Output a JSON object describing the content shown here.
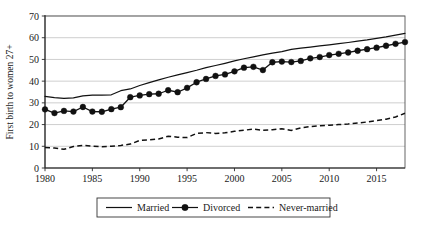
{
  "chart_data": {
    "type": "line",
    "title": "",
    "xlabel": "",
    "ylabel": "First birth to women 27+",
    "xlim": [
      1980,
      2018
    ],
    "ylim": [
      0,
      70
    ],
    "ytick_values": [
      0,
      10,
      20,
      30,
      40,
      50,
      60,
      70
    ],
    "ytick_labels": [
      "0",
      "10",
      "20",
      "30",
      "40",
      "50",
      "60",
      "70"
    ],
    "xtick_values": [
      1980,
      1985,
      1990,
      1995,
      2000,
      2005,
      2010,
      2015
    ],
    "xtick_labels": [
      "1980",
      "1985",
      "1990",
      "1995",
      "2000",
      "2005",
      "2010",
      "2015"
    ],
    "grid": "horizontal",
    "legend_position": "below-center",
    "x": [
      1980,
      1981,
      1982,
      1983,
      1984,
      1985,
      1986,
      1987,
      1988,
      1989,
      1990,
      1991,
      1992,
      1993,
      1994,
      1995,
      1996,
      1997,
      1998,
      1999,
      2000,
      2001,
      2002,
      2003,
      2004,
      2005,
      2006,
      2007,
      2008,
      2009,
      2010,
      2011,
      2012,
      2013,
      2014,
      2015,
      2016,
      2017,
      2018
    ],
    "series": [
      {
        "name": "Married",
        "style": "solid",
        "marker": "none",
        "color": "#111111",
        "values": [
          33.0,
          32.4,
          32.1,
          32.3,
          33.2,
          33.6,
          33.6,
          33.7,
          35.6,
          36.4,
          38.0,
          39.3,
          40.6,
          41.8,
          42.9,
          43.9,
          45.0,
          46.2,
          47.2,
          48.2,
          49.3,
          50.3,
          51.2,
          52.1,
          52.9,
          53.6,
          54.6,
          55.2,
          55.7,
          56.2,
          56.7,
          57.3,
          57.8,
          58.4,
          59.0,
          59.7,
          60.4,
          61.2,
          62.0
        ]
      },
      {
        "name": "Divorced",
        "style": "solid",
        "marker": "filled-circle",
        "color": "#111111",
        "values": [
          27.0,
          25.3,
          26.3,
          26.0,
          28.1,
          26.0,
          25.9,
          27.1,
          28.0,
          32.6,
          33.4,
          34.0,
          34.2,
          35.8,
          34.9,
          36.9,
          39.5,
          41.0,
          42.4,
          43.1,
          44.5,
          46.2,
          46.6,
          45.1,
          48.7,
          49.0,
          48.8,
          49.3,
          50.5,
          51.1,
          52.0,
          52.6,
          53.2,
          54.0,
          54.7,
          55.4,
          56.3,
          57.2,
          58.0
        ]
      },
      {
        "name": "Never-married",
        "style": "dashed",
        "marker": "none",
        "color": "#111111",
        "values": [
          9.4,
          9.2,
          8.6,
          9.9,
          10.4,
          10.1,
          9.8,
          10.0,
          10.4,
          11.0,
          12.7,
          13.0,
          13.4,
          14.6,
          14.2,
          14.0,
          15.9,
          16.3,
          15.9,
          16.2,
          16.9,
          17.4,
          17.9,
          17.4,
          17.6,
          18.1,
          17.3,
          18.5,
          19.1,
          19.4,
          19.7,
          20.0,
          20.3,
          20.7,
          21.2,
          21.8,
          22.5,
          23.5,
          25.2
        ]
      }
    ],
    "legend": [
      {
        "label": "Married",
        "style": "solid",
        "marker": "none"
      },
      {
        "label": "Divorced",
        "style": "solid",
        "marker": "filled-circle"
      },
      {
        "label": "Never-married",
        "style": "dashed",
        "marker": "none"
      }
    ]
  }
}
